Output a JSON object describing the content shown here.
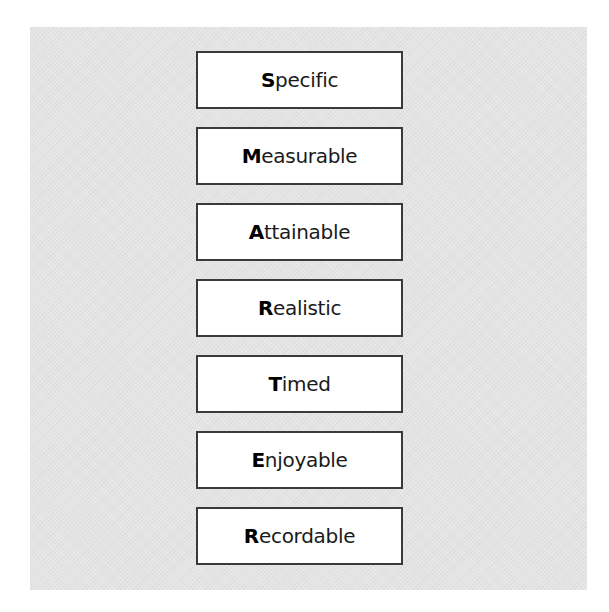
{
  "diagram": {
    "items": [
      {
        "initial": "S",
        "rest": "pecific"
      },
      {
        "initial": "M",
        "rest": "easurable"
      },
      {
        "initial": "A",
        "rest": "ttainable"
      },
      {
        "initial": "R",
        "rest": "ealistic"
      },
      {
        "initial": "T",
        "rest": "imed"
      },
      {
        "initial": "E",
        "rest": "njoyable"
      },
      {
        "initial": "R",
        "rest": "ecordable"
      }
    ]
  },
  "colors": {
    "panel": "#e4e4e4",
    "box_border": "#3a3a3a",
    "box_fill": "#ffffff"
  }
}
